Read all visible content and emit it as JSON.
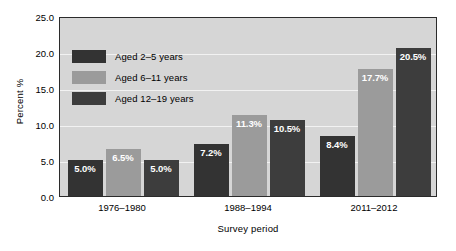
{
  "chart_data": {
    "type": "bar",
    "title": "",
    "xlabel": "Survey period",
    "ylabel": "Percent %",
    "categories": [
      "1976–1980",
      "1988–1994",
      "2011–2012"
    ],
    "series": [
      {
        "name": "Aged 2–5 years",
        "color": "#333333",
        "values": [
          5.0,
          7.2,
          8.4
        ],
        "labels": [
          "5.0%",
          "7.2%",
          "8.4%"
        ]
      },
      {
        "name": "Aged 6–11 years",
        "color": "#9b9b9b",
        "values": [
          6.5,
          11.3,
          17.7
        ],
        "labels": [
          "6.5%",
          "11.3%",
          "17.7%"
        ]
      },
      {
        "name": "Aged 12–19 years",
        "color": "#3d3d3d",
        "values": [
          5.0,
          10.5,
          20.5
        ],
        "labels": [
          "5.0%",
          "10.5%",
          "20.5%"
        ]
      }
    ],
    "ylim": [
      0.0,
      25.0
    ],
    "yticks": [
      0.0,
      5.0,
      10.0,
      15.0,
      20.0,
      25.0
    ],
    "ytick_labels": [
      "0.0",
      "5.0",
      "10.0",
      "15.0",
      "20.0",
      "25.0"
    ],
    "grid": true,
    "grid_color": "#f2f2f2",
    "plot_background": "#d6d6d6",
    "legend_position": "upper-left-inside",
    "value_label_color": "#ffffff"
  }
}
